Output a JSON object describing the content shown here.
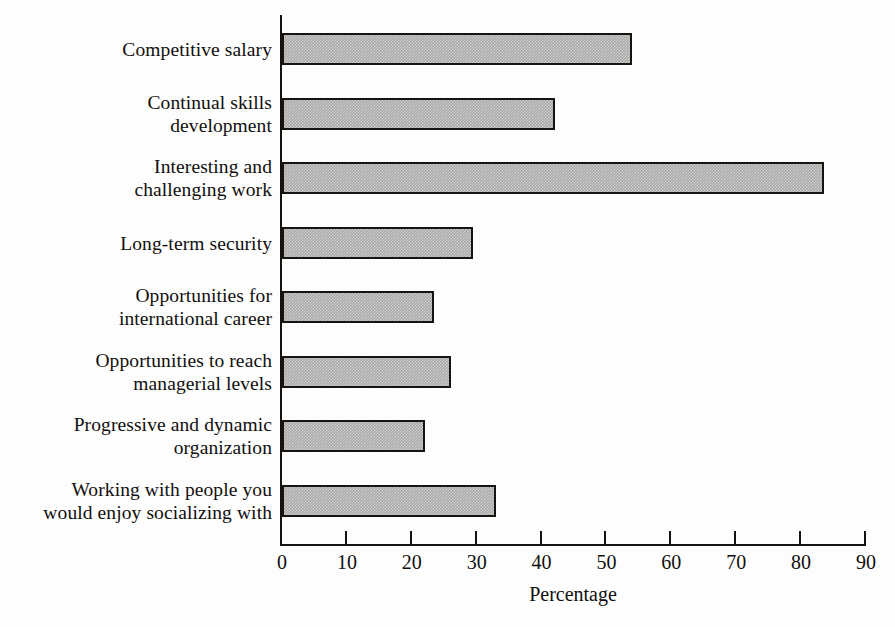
{
  "chart_data": {
    "type": "bar",
    "orientation": "horizontal",
    "title": "",
    "subtitle": "",
    "xlabel": "Percentage",
    "ylabel": "",
    "xlim": [
      0,
      90
    ],
    "xticks": [
      0,
      10,
      20,
      30,
      40,
      50,
      60,
      70,
      80,
      90
    ],
    "xtick_labels": [
      "0",
      "10",
      "20",
      "30",
      "40",
      "50",
      "60",
      "70",
      "80",
      "90"
    ],
    "grid": false,
    "legend": false,
    "legend_position": "none",
    "bar_fill_color": "#a9a9a9",
    "bar_edge_color": "#17140f",
    "background_color": "#fdfdfd",
    "text_color": "#110f0d",
    "categories": [
      "Competitive salary",
      "Continual skills\ndevelopment",
      "Interesting and\nchallenging work",
      "Long-term security",
      "Opportunities for\ninternational career",
      "Opportunities to reach\nmanagerial levels",
      "Progressive and dynamic\norganization",
      "Working with people you\nwould enjoy socializing with"
    ],
    "values": [
      54,
      42,
      83.5,
      29.5,
      23.5,
      26,
      22,
      33
    ],
    "series": [
      {
        "name": "Percentage",
        "values": [
          54,
          42,
          83.5,
          29.5,
          23.5,
          26,
          22,
          33
        ]
      }
    ]
  }
}
